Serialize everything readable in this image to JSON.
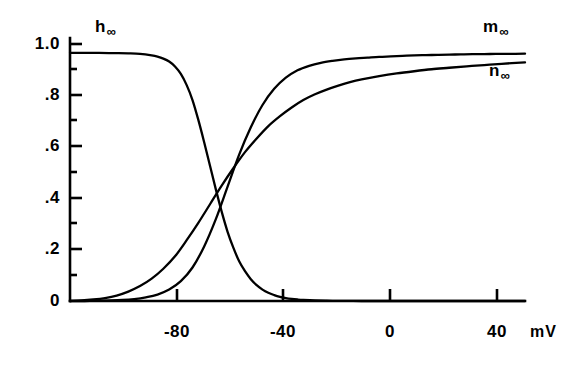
{
  "figure": {
    "background": "#ffffff",
    "ink_color": "#000000"
  },
  "chart_data": {
    "type": "line",
    "title": "",
    "subtitle": "",
    "xlabel": "mV",
    "ylabel": "",
    "xlim": [
      -100,
      56
    ],
    "ylim": [
      0,
      1.06
    ],
    "grid": false,
    "legend_position": "inline-curve-labels",
    "x_ticks": [
      -80,
      -40,
      0,
      40
    ],
    "x_tick_labels": [
      "-80",
      "-40",
      "0",
      "40"
    ],
    "x_minor_ticks": [],
    "y_ticks": [
      0,
      0.2,
      0.4,
      0.6,
      0.8,
      1.0
    ],
    "y_tick_labels": [
      "0",
      ".2",
      ".4",
      ".6",
      ".8",
      "1.0"
    ],
    "y_minor_ticks": [
      0.1,
      0.3,
      0.5,
      0.7,
      0.9
    ],
    "annotations": [
      {
        "text": "h",
        "sub": "∞",
        "x": -85,
        "y": 1.04
      },
      {
        "text": "m",
        "sub": "∞",
        "x": 40,
        "y": 1.04
      },
      {
        "text": "n",
        "sub": "∞",
        "x": 40,
        "y": 0.88
      }
    ],
    "series": [
      {
        "name": "h_inf",
        "label": "h",
        "subscript": "∞",
        "color": "#000000",
        "x": [
          -100,
          -95,
          -90,
          -85,
          -80,
          -76,
          -72,
          -70,
          -68,
          -66,
          -64,
          -62,
          -60,
          -58,
          -56,
          -54,
          -52,
          -50,
          -48,
          -46,
          -44,
          -42,
          -40,
          -38,
          -36,
          -34,
          -32,
          -30,
          -28,
          -26,
          -24,
          -22,
          -20,
          -16,
          -12,
          -8,
          -4,
          0,
          10,
          20,
          30,
          40,
          50,
          56
        ],
        "y": [
          1.0,
          1.0,
          1.0,
          0.999,
          0.998,
          0.996,
          0.99,
          0.985,
          0.977,
          0.965,
          0.945,
          0.915,
          0.87,
          0.81,
          0.73,
          0.64,
          0.545,
          0.45,
          0.36,
          0.28,
          0.215,
          0.16,
          0.12,
          0.088,
          0.064,
          0.046,
          0.033,
          0.024,
          0.017,
          0.012,
          0.0085,
          0.006,
          0.0042,
          0.002,
          0.001,
          0.0005,
          0.0002,
          0.0001,
          0,
          0,
          0,
          0,
          0,
          0
        ]
      },
      {
        "name": "m_inf",
        "label": "m",
        "subscript": "∞",
        "color": "#000000",
        "x": [
          -100,
          -95,
          -90,
          -86,
          -82,
          -78,
          -74,
          -70,
          -66,
          -62,
          -58,
          -54,
          -50,
          -46,
          -42,
          -38,
          -34,
          -30,
          -26,
          -22,
          -18,
          -14,
          -10,
          -6,
          -2,
          2,
          6,
          10,
          14,
          18,
          22,
          26,
          30,
          34,
          38,
          42,
          46,
          50,
          56
        ],
        "y": [
          0.0,
          0.0,
          0.001,
          0.002,
          0.004,
          0.008,
          0.015,
          0.026,
          0.046,
          0.08,
          0.135,
          0.22,
          0.33,
          0.46,
          0.59,
          0.7,
          0.79,
          0.855,
          0.9,
          0.93,
          0.948,
          0.96,
          0.968,
          0.974,
          0.978,
          0.981,
          0.984,
          0.986,
          0.988,
          0.99,
          0.991,
          0.992,
          0.993,
          0.994,
          0.995,
          0.995,
          0.996,
          0.996,
          0.997
        ]
      },
      {
        "name": "n_inf",
        "label": "n",
        "subscript": "∞",
        "color": "#000000",
        "x": [
          -100,
          -96,
          -92,
          -88,
          -84,
          -80,
          -76,
          -72,
          -68,
          -64,
          -60,
          -56,
          -52,
          -48,
          -44,
          -40,
          -36,
          -32,
          -28,
          -24,
          -20,
          -16,
          -12,
          -8,
          -4,
          0,
          6,
          12,
          18,
          24,
          30,
          36,
          42,
          48,
          56
        ],
        "y": [
          0.0,
          0.002,
          0.006,
          0.012,
          0.022,
          0.038,
          0.06,
          0.09,
          0.13,
          0.18,
          0.245,
          0.315,
          0.39,
          0.465,
          0.535,
          0.6,
          0.655,
          0.705,
          0.745,
          0.78,
          0.81,
          0.833,
          0.852,
          0.868,
          0.882,
          0.893,
          0.906,
          0.917,
          0.926,
          0.934,
          0.94,
          0.946,
          0.951,
          0.956,
          0.962
        ]
      }
    ],
    "notable_points": [
      {
        "label": "h_inf crosses n_inf",
        "x": -58,
        "y": 0.4
      },
      {
        "label": "h_inf crosses m_inf",
        "x": -50,
        "y": 0.22
      },
      {
        "label": "m_inf crosses n_inf",
        "x": -20,
        "y": 0.83
      }
    ]
  },
  "axis": {
    "x_unit_label": "mV"
  }
}
